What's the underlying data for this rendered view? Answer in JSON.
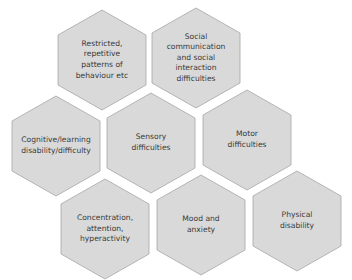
{
  "diagram": {
    "title": "",
    "fill_color": "#d9d9d9",
    "stroke_color": "#a6a6a6",
    "text_color": "#3a3a3a",
    "nodes": [
      {
        "id": "restricted",
        "label": "Restricted,\nrepetitive\npatterns of\nbehaviour  etc",
        "row": 1,
        "col": 1
      },
      {
        "id": "social",
        "label": "Social\ncommunication\nand social\ninteraction\ndifficulties",
        "row": 1,
        "col": 2
      },
      {
        "id": "cognitive",
        "label": "Cognitive/learning\ndisability/difficulty",
        "row": 2,
        "col": 1
      },
      {
        "id": "sensory",
        "label": "Sensory\ndifficulties",
        "row": 2,
        "col": 2
      },
      {
        "id": "motor",
        "label": "Motor\ndifficulties",
        "row": 2,
        "col": 3
      },
      {
        "id": "concentration",
        "label": "Concentration,\nattention,\nhyperactivity",
        "row": 3,
        "col": 1
      },
      {
        "id": "mood",
        "label": "Mood and\nanxiety",
        "row": 3,
        "col": 2
      },
      {
        "id": "physical",
        "label": "Physical\ndisability",
        "row": 3,
        "col": 3
      }
    ]
  }
}
